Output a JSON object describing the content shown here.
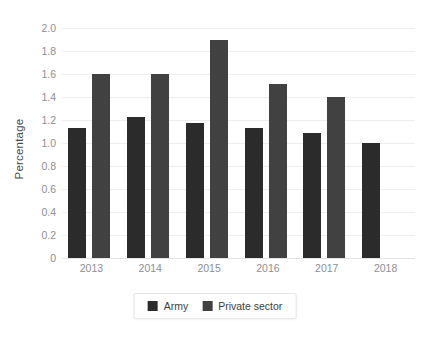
{
  "chart_data": {
    "type": "bar",
    "title": "",
    "subtitle": "",
    "xlabel": "",
    "ylabel": "Percentage",
    "ylim": [
      0,
      2.0
    ],
    "ytick_step": 0.2,
    "grid": true,
    "legend_position": "bottom",
    "categories": [
      "2013",
      "2014",
      "2015",
      "2016",
      "2017",
      "2018"
    ],
    "series": [
      {
        "name": "Army",
        "color": "#2b2b2b",
        "values": [
          1.13,
          1.23,
          1.17,
          1.13,
          1.09,
          1.0
        ]
      },
      {
        "name": "Private sector",
        "color": "#414141",
        "values": [
          1.6,
          1.6,
          1.9,
          1.51,
          1.4,
          null
        ]
      }
    ],
    "ytick_labels": [
      "0",
      "0.2",
      "0.4",
      "0.6",
      "0.8",
      "1.0",
      "1.2",
      "1.4",
      "1.6",
      "1.8",
      "2.0"
    ],
    "ytick_values": [
      0,
      0.2,
      0.4,
      0.6,
      0.8,
      1.0,
      1.2,
      1.4,
      1.6,
      1.8,
      2.0
    ]
  },
  "axes": {
    "y_title": "Percentage"
  },
  "legend": {
    "items": [
      {
        "label": "Army",
        "color": "#2b2b2b"
      },
      {
        "label": "Private sector",
        "color": "#414141"
      }
    ]
  },
  "colors": {
    "background": "#ffffff",
    "gridline": "#eceef0",
    "baseline": "#e2e4e6",
    "tick_text": "#8c8f93",
    "axis_title_text": "#4a4a4a",
    "legend_text": "#3d3d3d",
    "legend_border": "#e6e6e6"
  }
}
